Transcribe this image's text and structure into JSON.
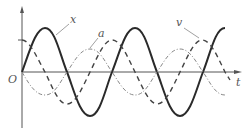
{
  "figure": {
    "type": "waveform-diagram",
    "axes": {
      "origin_label": "O",
      "x_axis_label": "t",
      "y_axis_label": ""
    },
    "curves": [
      {
        "name": "x",
        "label": "x",
        "style": "solid-thick",
        "phase": "sine",
        "amplitude_px": 44
      },
      {
        "name": "v",
        "label": "v",
        "style": "dashed",
        "phase": "cosine",
        "amplitude_px": 32
      },
      {
        "name": "a",
        "label": "a",
        "style": "dash-dot-thin",
        "phase": "negative-sine",
        "amplitude_px": 22
      }
    ],
    "colors": {
      "axis": "#555555",
      "solid": "#2a2a2a",
      "dashed": "#444444",
      "dashdot": "#888888"
    }
  }
}
